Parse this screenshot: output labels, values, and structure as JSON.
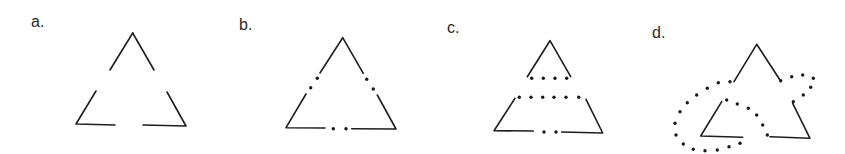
{
  "figure": {
    "panels": [
      {
        "label": "a.",
        "label_pos": [
          31,
          27
        ],
        "description": "triangle with gaps at the middle of each side",
        "segments": [
          [
            [
              132.7,
              33
            ],
            [
              110,
              70
            ]
          ],
          [
            [
              132.7,
              33
            ],
            [
              154,
              70
            ]
          ],
          [
            [
              96,
              91
            ],
            [
              76,
              124
            ],
            [
              115,
              125
            ]
          ],
          [
            [
              143,
              125
            ],
            [
              186,
              126
            ],
            [
              167,
              92
            ]
          ]
        ],
        "dots": []
      },
      {
        "label": "b.",
        "label_pos": [
          239,
          30
        ],
        "description": "triangle with gaps filled by two dots each",
        "segments": [
          [
            [
              320,
              73
            ],
            [
              342.7,
              37.7
            ],
            [
              363.3,
              73.3
            ]
          ],
          [
            [
              306,
              94
            ],
            [
              286,
              127.7
            ],
            [
              325,
              128
            ]
          ],
          [
            [
              351.7,
              128.7
            ],
            [
              396,
              129
            ],
            [
              377.3,
              95
            ]
          ]
        ],
        "dots": [
          [
            317.3,
            78.3
          ],
          [
            310.7,
            87.7
          ],
          [
            366.7,
            79.3
          ],
          [
            373.3,
            89
          ],
          [
            333.3,
            128.7
          ],
          [
            346,
            128.7
          ]
        ]
      },
      {
        "label": "c.",
        "label_pos": [
          447,
          33
        ],
        "description": "triangle split into top triangle and trapezoid by dotted horizontal lines",
        "segments": [
          [
            [
              527.3,
              76.7
            ],
            [
              550,
              40.7
            ],
            [
              570.7,
              76.7
            ]
          ],
          [
            [
              515,
              98.3
            ],
            [
              494,
              130.7
            ],
            [
              533.3,
              131
            ]
          ],
          [
            [
              561.7,
              132
            ],
            [
              602.7,
              133
            ],
            [
              586,
              99.3
            ]
          ]
        ],
        "dots": [
          [
            531.7,
            78.3
          ],
          [
            543.3,
            78.3
          ],
          [
            555,
            78.3
          ],
          [
            566.7,
            78.3
          ],
          [
            519.3,
            97.3
          ],
          [
            531,
            97.3
          ],
          [
            542.7,
            97.3
          ],
          [
            554,
            97.3
          ],
          [
            566,
            97.3
          ],
          [
            578.7,
            97.3
          ],
          [
            544,
            132
          ],
          [
            556,
            132
          ]
        ]
      },
      {
        "label": "d.",
        "label_pos": [
          652,
          38
        ],
        "description": "triangle fragments completed by a dotted curved path",
        "segments": [
          [
            [
              734,
              81.7
            ],
            [
              756.7,
              44.3
            ],
            [
              780,
              80
            ]
          ],
          [
            [
              721.7,
              101.7
            ],
            [
              700.7,
              136
            ],
            [
              742.7,
              137.3
            ]
          ],
          [
            [
              770,
              136.7
            ],
            [
              810,
              138.3
            ],
            [
              792.7,
              103.3
            ]
          ]
        ],
        "dots": [
          [
            730,
            81.7
          ],
          [
            718.3,
            82.7
          ],
          [
            707.3,
            88.3
          ],
          [
            696.7,
            95
          ],
          [
            687.3,
            102.7
          ],
          [
            680,
            111.7
          ],
          [
            675,
            123.3
          ],
          [
            676,
            135
          ],
          [
            683.3,
            144
          ],
          [
            693.3,
            149.3
          ],
          [
            705,
            150.7
          ],
          [
            717.3,
            150
          ],
          [
            729,
            146.7
          ],
          [
            740,
            143.3
          ],
          [
            726.7,
            100
          ],
          [
            737.3,
            104
          ],
          [
            748.3,
            108.3
          ],
          [
            756.7,
            115
          ],
          [
            762.7,
            125
          ],
          [
            767.3,
            135
          ],
          [
            780.7,
            80.7
          ],
          [
            791.7,
            76.7
          ],
          [
            802.7,
            75
          ],
          [
            813.3,
            78.3
          ],
          [
            810.7,
            87.3
          ],
          [
            803.3,
            95
          ],
          [
            793.3,
            101.7
          ]
        ]
      }
    ],
    "colors": {
      "stroke": "#1e1e1e",
      "dot": "#1a1a1a",
      "background": "#ffffff"
    }
  }
}
